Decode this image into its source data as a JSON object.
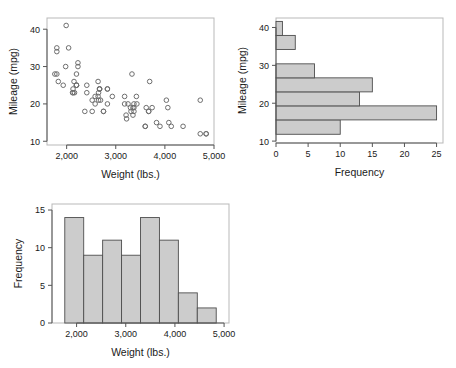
{
  "figure": {
    "panels": [
      "scatter-mileage-vs-weight",
      "histogram-mileage",
      "histogram-weight"
    ]
  },
  "chart_data": [
    {
      "id": "scatter",
      "type": "scatter",
      "title": "",
      "xlabel": "Weight (lbs.)",
      "ylabel": "Mileage (mpg)",
      "xlim": [
        1600,
        5000
      ],
      "ylim": [
        9,
        43
      ],
      "xticks": [
        2000,
        3000,
        4000,
        5000
      ],
      "xticklabels": [
        "2,000",
        "3,000",
        "4,000",
        "5,000"
      ],
      "yticks": [
        10,
        20,
        30,
        40
      ],
      "yticklabels": [
        "10",
        "20",
        "30",
        "40"
      ],
      "grid": false,
      "legend": "none",
      "marker": "open-circle",
      "points": [
        [
          2930,
          22
        ],
        [
          3350,
          17
        ],
        [
          2640,
          22
        ],
        [
          3250,
          20
        ],
        [
          4080,
          15
        ],
        [
          3670,
          18
        ],
        [
          3690,
          26
        ],
        [
          3180,
          20
        ],
        [
          3220,
          16
        ],
        [
          4060,
          19
        ],
        [
          3600,
          14
        ],
        [
          3600,
          14
        ],
        [
          4720,
          21
        ],
        [
          3740,
          19
        ],
        [
          1800,
          35
        ],
        [
          4840,
          12
        ],
        [
          3900,
          14
        ],
        [
          4130,
          14
        ],
        [
          4370,
          14
        ],
        [
          4030,
          21
        ],
        [
          3620,
          19
        ],
        [
          4840,
          12
        ],
        [
          4720,
          12
        ],
        [
          3830,
          15
        ],
        [
          2580,
          20
        ],
        [
          2200,
          25
        ],
        [
          2520,
          18
        ],
        [
          2650,
          21
        ],
        [
          1800,
          28
        ],
        [
          3310,
          18
        ],
        [
          3670,
          18
        ],
        [
          3370,
          18
        ],
        [
          2830,
          24
        ],
        [
          2580,
          22
        ],
        [
          2200,
          25
        ],
        [
          1980,
          30
        ],
        [
          2200,
          28
        ],
        [
          2150,
          26
        ],
        [
          1930,
          25
        ],
        [
          2640,
          26
        ],
        [
          2130,
          24
        ],
        [
          2040,
          35
        ],
        [
          1990,
          41
        ],
        [
          3330,
          28
        ],
        [
          2160,
          23
        ],
        [
          2670,
          24
        ],
        [
          3370,
          19
        ],
        [
          2750,
          18
        ],
        [
          2230,
          31
        ],
        [
          2370,
          18
        ],
        [
          2130,
          23
        ],
        [
          2650,
          23
        ],
        [
          1760,
          28
        ],
        [
          3420,
          22
        ],
        [
          3300,
          19
        ],
        [
          2830,
          20
        ],
        [
          2120,
          23
        ],
        [
          2410,
          23
        ],
        [
          2830,
          24
        ],
        [
          2410,
          25
        ],
        [
          2520,
          21
        ],
        [
          1800,
          34
        ],
        [
          2690,
          21
        ],
        [
          2200,
          25
        ],
        [
          3180,
          22
        ],
        [
          2670,
          24
        ],
        [
          3350,
          19
        ],
        [
          3370,
          20
        ],
        [
          3430,
          20
        ],
        [
          2230,
          30
        ],
        [
          1830,
          26
        ],
        [
          2750,
          18
        ],
        [
          3210,
          17
        ],
        [
          2670,
          24
        ]
      ]
    },
    {
      "id": "hist_mileage",
      "type": "bar",
      "orientation": "horizontal",
      "title": "",
      "xlabel": "Frequency",
      "ylabel": "Mileage (mpg)",
      "xlim": [
        0,
        26
      ],
      "ylim": [
        9.5,
        42.5
      ],
      "xticks": [
        0,
        5,
        10,
        15,
        20,
        25
      ],
      "xticklabels": [
        "0",
        "5",
        "10",
        "15",
        "20",
        "25"
      ],
      "yticks": [
        10,
        20,
        30,
        40
      ],
      "yticklabels": [
        "10",
        "20",
        "30",
        "40"
      ],
      "grid": false,
      "legend": "none",
      "bin_edges": [
        11.8,
        15.6,
        19.3,
        23.0,
        26.7,
        30.4,
        34.2,
        37.9,
        41.6
      ],
      "bins": [
        {
          "lo": 11.8,
          "hi": 15.6,
          "count": 10
        },
        {
          "lo": 15.6,
          "hi": 19.3,
          "count": 25
        },
        {
          "lo": 19.3,
          "hi": 23.0,
          "count": 13
        },
        {
          "lo": 23.0,
          "hi": 26.7,
          "count": 15
        },
        {
          "lo": 26.7,
          "hi": 30.4,
          "count": 6
        },
        {
          "lo": 30.4,
          "hi": 34.2,
          "count": 0
        },
        {
          "lo": 34.2,
          "hi": 37.9,
          "count": 3
        },
        {
          "lo": 37.9,
          "hi": 41.6,
          "count": 1
        }
      ]
    },
    {
      "id": "hist_weight",
      "type": "bar",
      "orientation": "vertical",
      "title": "",
      "xlabel": "Weight (lbs.)",
      "ylabel": "Frequency",
      "xlim": [
        1500,
        5100
      ],
      "ylim": [
        0,
        15.8
      ],
      "xticks": [
        2000,
        3000,
        4000,
        5000
      ],
      "xticklabels": [
        "2,000",
        "3,000",
        "4,000",
        "5,000"
      ],
      "yticks": [
        0,
        5,
        10,
        15
      ],
      "yticklabels": [
        "0",
        "5",
        "10",
        "15"
      ],
      "grid": false,
      "legend": "none",
      "bin_edges": [
        1760,
        2145,
        2530,
        2915,
        3300,
        3685,
        4070,
        4455,
        4840
      ],
      "bins": [
        {
          "lo": 1760,
          "hi": 2145,
          "count": 14
        },
        {
          "lo": 2145,
          "hi": 2530,
          "count": 9
        },
        {
          "lo": 2530,
          "hi": 2915,
          "count": 11
        },
        {
          "lo": 2915,
          "hi": 3300,
          "count": 9
        },
        {
          "lo": 3300,
          "hi": 3685,
          "count": 14
        },
        {
          "lo": 3685,
          "hi": 4070,
          "count": 11
        },
        {
          "lo": 4070,
          "hi": 4455,
          "count": 4
        },
        {
          "lo": 4455,
          "hi": 4840,
          "count": 2
        }
      ]
    }
  ],
  "style": {
    "bar_fill": "#cccccc",
    "bar_stroke": "#4d4d4d",
    "marker_stroke": "#6e6e6e",
    "axis_color": "#555555",
    "frame_color": "#b9b9b9",
    "background": "#ffffff"
  }
}
